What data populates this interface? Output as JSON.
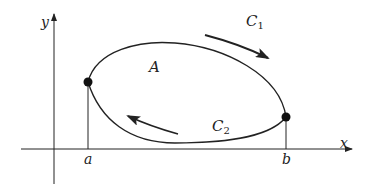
{
  "diagram": {
    "type": "closed-curve-line-integral",
    "axes": {
      "x_label": "x",
      "y_label": "y"
    },
    "points": [
      {
        "id": "a",
        "label": "a",
        "x": 88,
        "y": 82
      },
      {
        "id": "b",
        "label": "b",
        "x": 286,
        "y": 117
      }
    ],
    "region_label": "A",
    "curves": [
      {
        "id": "C1",
        "label_main": "C",
        "label_sub": "1",
        "role": "upper curve",
        "direction": "left-to-right (clockwise)"
      },
      {
        "id": "C2",
        "label_main": "C",
        "label_sub": "2",
        "role": "lower curve",
        "direction": "right-to-left (clockwise)"
      }
    ],
    "colors": {
      "stroke": "#222222",
      "background": "#ffffff"
    }
  }
}
